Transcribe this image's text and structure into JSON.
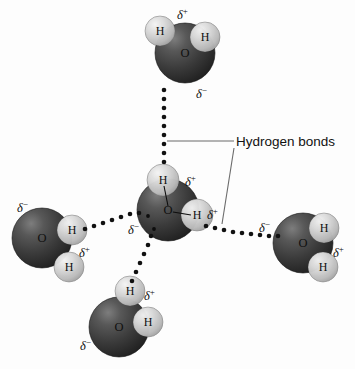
{
  "figure": {
    "background_color": "#fdfdfd",
    "oxygen_color": "#3a3a3a",
    "oxygen_highlight_color": "#7d7d7d",
    "hydrogen_color": "#c9c9c9",
    "hydrogen_highlight_color": "#efefef",
    "bond_dot_color": "#111111",
    "leader_line_color": "#6b6b6b",
    "text_color": "#111111"
  },
  "callouts": [
    {
      "id": "hydrogen-bonds",
      "label": "Hydrogen bonds",
      "text_x": 236,
      "text_y": 142,
      "leaders": [
        {
          "id": "leader-horizontal",
          "x1": 167,
          "y1": 141,
          "x2": 234,
          "y2": 141
        },
        {
          "id": "leader-diagonal",
          "x1": 234,
          "y1": 148,
          "x2": 222,
          "y2": 224
        }
      ]
    }
  ],
  "molecules": [
    {
      "id": "water-top",
      "name": "water-molecule-top",
      "oxygen": {
        "label": "O",
        "cx": 185,
        "cy": 53,
        "r": 30
      },
      "hydrogens": [
        {
          "label": "H",
          "cx": 160,
          "cy": 31,
          "r": 15
        },
        {
          "label": "H",
          "cx": 205,
          "cy": 37,
          "r": 15
        }
      ],
      "charges": [
        {
          "sign": "+",
          "text": "δ",
          "x": 177,
          "y": 9
        },
        {
          "sign": "-",
          "text": "δ",
          "x": 196,
          "y": 88
        }
      ],
      "internal_bonds": []
    },
    {
      "id": "water-center",
      "name": "water-molecule-center",
      "oxygen": {
        "label": "O",
        "cx": 168,
        "cy": 210,
        "r": 31
      },
      "hydrogens": [
        {
          "label": "H",
          "cx": 163,
          "cy": 180,
          "r": 16
        },
        {
          "label": "H",
          "cx": 197,
          "cy": 215,
          "r": 16
        }
      ],
      "charges": [
        {
          "sign": "+",
          "text": "δ",
          "x": 185,
          "y": 176
        },
        {
          "sign": "+",
          "text": "δ",
          "x": 207,
          "y": 209
        },
        {
          "sign": "-",
          "text": "δ",
          "x": 128,
          "y": 224
        }
      ],
      "internal_bonds": [
        {
          "x1": 168,
          "y1": 206,
          "x2": 164,
          "y2": 186
        },
        {
          "x1": 173,
          "y1": 212,
          "x2": 191,
          "y2": 215
        }
      ],
      "lone_pair_dots": [
        {
          "cx": 148,
          "cy": 216,
          "r": 1.9
        },
        {
          "cx": 154,
          "cy": 229,
          "r": 1.9
        }
      ]
    },
    {
      "id": "water-left",
      "name": "water-molecule-left",
      "oxygen": {
        "label": "O",
        "cx": 42,
        "cy": 238,
        "r": 30
      },
      "hydrogens": [
        {
          "label": "H",
          "cx": 72,
          "cy": 230,
          "r": 15
        },
        {
          "label": "H",
          "cx": 69,
          "cy": 267,
          "r": 15
        }
      ],
      "charges": [
        {
          "sign": "-",
          "text": "δ",
          "x": 17,
          "y": 202
        },
        {
          "sign": "+",
          "text": "δ",
          "x": 79,
          "y": 247
        }
      ],
      "internal_bonds": []
    },
    {
      "id": "water-right",
      "name": "water-molecule-right",
      "oxygen": {
        "label": "O",
        "cx": 303,
        "cy": 243,
        "r": 30
      },
      "hydrogens": [
        {
          "label": "H",
          "cx": 324,
          "cy": 228,
          "r": 15
        },
        {
          "label": "H",
          "cx": 323,
          "cy": 267,
          "r": 15
        }
      ],
      "charges": [
        {
          "sign": "-",
          "text": "δ",
          "x": 259,
          "y": 222
        },
        {
          "sign": "+",
          "text": "δ",
          "x": 333,
          "y": 247
        }
      ],
      "internal_bonds": []
    },
    {
      "id": "water-bottom",
      "name": "water-molecule-bottom",
      "oxygen": {
        "label": "O",
        "cx": 119,
        "cy": 327,
        "r": 30
      },
      "hydrogens": [
        {
          "label": "H",
          "cx": 130,
          "cy": 291,
          "r": 15
        },
        {
          "label": "H",
          "cx": 148,
          "cy": 322,
          "r": 15
        }
      ],
      "charges": [
        {
          "sign": "+",
          "text": "δ",
          "x": 144,
          "y": 290
        },
        {
          "sign": "-",
          "text": "δ",
          "x": 80,
          "y": 340
        }
      ],
      "internal_bonds": []
    }
  ],
  "hydrogen_bonds": [
    {
      "id": "hbond-top",
      "name": "hydrogen-bond-top",
      "from": "water-top",
      "to": "water-center",
      "dots": [
        {
          "cx": 164,
          "cy": 90
        },
        {
          "cx": 164,
          "cy": 99
        },
        {
          "cx": 164,
          "cy": 108
        },
        {
          "cx": 164,
          "cy": 117
        },
        {
          "cx": 164,
          "cy": 126
        },
        {
          "cx": 164,
          "cy": 135
        },
        {
          "cx": 164,
          "cy": 144
        },
        {
          "cx": 164,
          "cy": 153
        },
        {
          "cx": 164,
          "cy": 162
        }
      ]
    },
    {
      "id": "hbond-left",
      "name": "hydrogen-bond-left",
      "from": "water-left",
      "to": "water-center",
      "dots": [
        {
          "cx": 85,
          "cy": 229
        },
        {
          "cx": 94,
          "cy": 226
        },
        {
          "cx": 103,
          "cy": 223
        },
        {
          "cx": 112,
          "cy": 220
        },
        {
          "cx": 121,
          "cy": 217
        },
        {
          "cx": 130,
          "cy": 214
        },
        {
          "cx": 139,
          "cy": 213
        }
      ]
    },
    {
      "id": "hbond-right",
      "name": "hydrogen-bond-right",
      "from": "water-center",
      "to": "water-right",
      "dots": [
        {
          "cx": 206,
          "cy": 226
        },
        {
          "cx": 215,
          "cy": 228
        },
        {
          "cx": 224,
          "cy": 230
        },
        {
          "cx": 233,
          "cy": 232
        },
        {
          "cx": 242,
          "cy": 233
        },
        {
          "cx": 251,
          "cy": 234
        },
        {
          "cx": 260,
          "cy": 235
        },
        {
          "cx": 269,
          "cy": 236
        },
        {
          "cx": 278,
          "cy": 236
        }
      ]
    },
    {
      "id": "hbond-bottom",
      "name": "hydrogen-bond-bottom",
      "from": "water-center",
      "to": "water-bottom",
      "dots": [
        {
          "cx": 151,
          "cy": 236
        },
        {
          "cx": 148,
          "cy": 245
        },
        {
          "cx": 144,
          "cy": 254
        },
        {
          "cx": 140,
          "cy": 263
        },
        {
          "cx": 136,
          "cy": 272
        },
        {
          "cx": 132,
          "cy": 281
        }
      ]
    }
  ]
}
